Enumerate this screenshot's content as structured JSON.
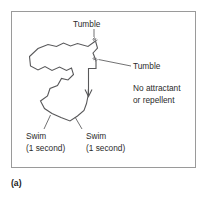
{
  "figure": {
    "caption": "(a)",
    "frame_color": "#9a9a9a",
    "track_color": "#58585a",
    "background": "#ffffff"
  },
  "labels": {
    "tumble_top": "Tumble",
    "tumble_right": "Tumble",
    "condition_line1": "No attractant",
    "condition_line2": "or repellent",
    "swim_left_line1": "Swim",
    "swim_left_line2": "(1 second)",
    "swim_right_line1": "Swim",
    "swim_right_line2": "(1 second)"
  },
  "diagram_data": {
    "type": "trajectory",
    "description": "Random-walk swimming track of a bacterium in the absence of attractant or repellent, showing straight swim runs punctuated by tumbles",
    "run_duration": "1 second",
    "tumble_count": 2,
    "annotated_events": [
      "Tumble",
      "Tumble",
      "Swim",
      "Swim"
    ],
    "track_points": [
      [
        95.5,
        41.0
      ],
      [
        88.0,
        46.5
      ],
      [
        77.5,
        43.5
      ],
      [
        70.5,
        46.0
      ],
      [
        63.5,
        43.0
      ],
      [
        56.5,
        46.5
      ],
      [
        48.0,
        44.5
      ],
      [
        38.0,
        48.5
      ],
      [
        29.5,
        56.5
      ],
      [
        30.5,
        66.0
      ],
      [
        38.0,
        70.0
      ],
      [
        45.0,
        66.5
      ],
      [
        52.0,
        70.5
      ],
      [
        59.5,
        67.0
      ],
      [
        66.5,
        70.5
      ],
      [
        71.5,
        68.0
      ],
      [
        73.5,
        74.5
      ],
      [
        68.0,
        80.0
      ],
      [
        61.5,
        78.5
      ],
      [
        57.5,
        85.5
      ],
      [
        50.0,
        88.5
      ],
      [
        47.5,
        96.0
      ],
      [
        40.5,
        101.0
      ],
      [
        44.5,
        108.5
      ],
      [
        52.0,
        113.5
      ],
      [
        61.0,
        117.5
      ],
      [
        70.0,
        121.0
      ],
      [
        77.5,
        116.0
      ],
      [
        84.0,
        110.5
      ],
      [
        86.5,
        103.5
      ],
      [
        88.0,
        96.0
      ],
      [
        88.5,
        88.5
      ]
    ],
    "arrow_path": [
      [
        96.0,
        61.0
      ],
      [
        96.0,
        68.5
      ],
      [
        88.5,
        68.5
      ],
      [
        88.5,
        78.0
      ],
      [
        88.5,
        96.5
      ]
    ],
    "tumble_markers": [
      {
        "x": 95.5,
        "y": 41.0,
        "label": "Tumble"
      },
      {
        "x": 96.0,
        "y": 61.0,
        "label": "Tumble"
      }
    ]
  }
}
